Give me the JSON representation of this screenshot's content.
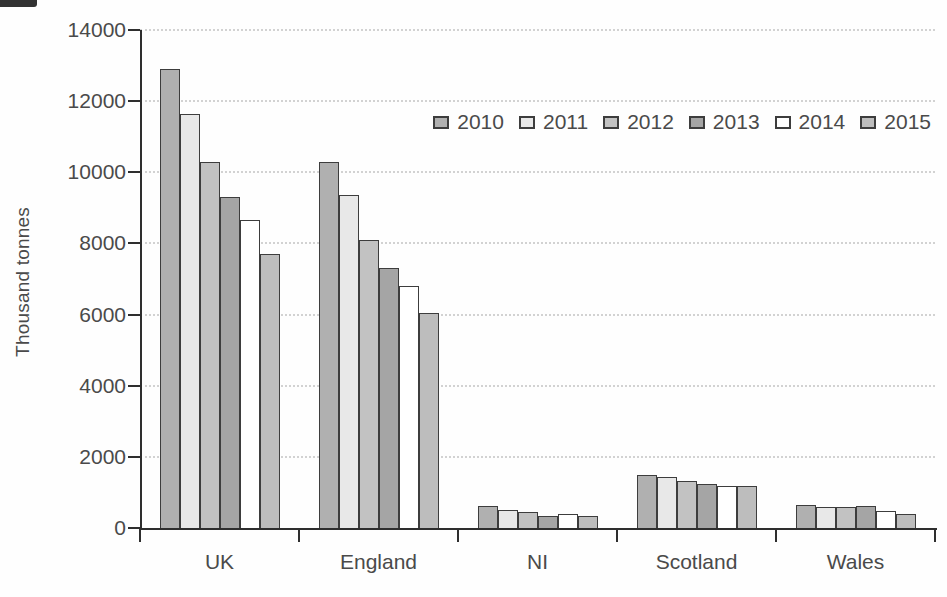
{
  "chart_data": {
    "type": "bar",
    "title": "",
    "xlabel": "",
    "ylabel": "Thousand tonnes",
    "ylim": [
      0,
      14000
    ],
    "ytick_step": 2000,
    "grid": true,
    "legend_position": "top-right",
    "categories": [
      "UK",
      "England",
      "NI",
      "Scotland",
      "Wales"
    ],
    "series": [
      {
        "name": "2010",
        "color": "#b0b0b0",
        "values": [
          12900,
          10300,
          620,
          1500,
          650
        ]
      },
      {
        "name": "2011",
        "color": "#e8e8e8",
        "values": [
          11650,
          9350,
          500,
          1420,
          580
        ]
      },
      {
        "name": "2012",
        "color": "#c2c2c2",
        "values": [
          10300,
          8100,
          450,
          1320,
          580
        ]
      },
      {
        "name": "2013",
        "color": "#a5a5a5",
        "values": [
          9300,
          7300,
          330,
          1230,
          630
        ]
      },
      {
        "name": "2014",
        "color": "#ffffff",
        "values": [
          8650,
          6800,
          400,
          1180,
          470
        ]
      },
      {
        "name": "2015",
        "color": "#bdbdbd",
        "values": [
          7700,
          6050,
          330,
          1180,
          390
        ]
      }
    ],
    "axis_color": "#2e2e2e",
    "gridline_color": "#d2d2d2",
    "text_color": "#4a4a4a"
  }
}
